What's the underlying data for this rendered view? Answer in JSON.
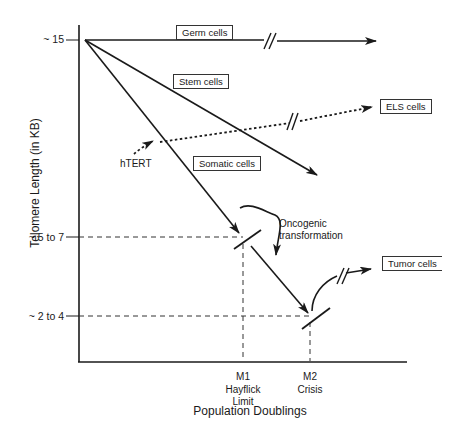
{
  "figure": {
    "y_axis": {
      "label": "Telomere Length (in KB)",
      "ticks": [
        "~ 15",
        "~ 5 to 7",
        "~ 2 to 4"
      ]
    },
    "x_axis": {
      "label": "Population Doublings",
      "ticks": [
        {
          "line1": "M1",
          "line2": "Hayflick",
          "line3": "Limit"
        },
        {
          "line1": "M2",
          "line2": "Crisis",
          "line3": ""
        }
      ]
    },
    "lines": {
      "germ": "Germ cells",
      "stem": "Stem cells",
      "els": "ELS cells",
      "somatic": "Somatic cells",
      "tumor": "Tumor cells"
    },
    "annotations": {
      "htert": "hTERT",
      "oncogenic_1": "Oncogenic",
      "oncogenic_2": "transformation"
    }
  }
}
